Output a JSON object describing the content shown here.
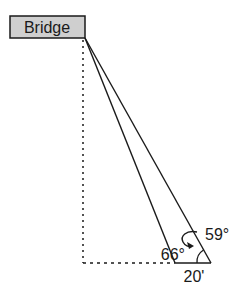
{
  "diagram": {
    "box_label": "Bridge",
    "angle_left": "66°",
    "angle_right": "59°",
    "base_distance": "20'",
    "colors": {
      "box_fill": "#cfcfcf",
      "line": "#1a1a1a"
    }
  }
}
